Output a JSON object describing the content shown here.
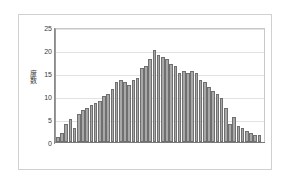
{
  "figure": {
    "background_color": "#ffffff",
    "frame_color": "#d0d0d0"
  },
  "chart_data": {
    "type": "bar",
    "title": "",
    "subtitle": "",
    "xlabel": "",
    "ylabel": "度数",
    "ylim": [
      0,
      25
    ],
    "yticks": [
      0,
      5,
      10,
      15,
      20,
      25
    ],
    "ytick_labels": [
      "0",
      "5",
      "10",
      "15",
      "20",
      "25"
    ],
    "xlim": [
      0,
      50
    ],
    "xticks": [],
    "xtick_labels": [],
    "grid": true,
    "grid_axis": "y",
    "grid_color": "#e2e2e2",
    "legend": null,
    "legend_position": "none",
    "bar_fill_color": "#a8a8a8",
    "bar_edge_color": "#6f6f6f",
    "axis_color": "#8a8a8a",
    "plot_border_color": "#c8c8c8",
    "tick_label_color": "#3a3a3a",
    "categories": [
      "1",
      "2",
      "3",
      "4",
      "5",
      "6",
      "7",
      "8",
      "9",
      "10",
      "11",
      "12",
      "13",
      "14",
      "15",
      "16",
      "17",
      "18",
      "19",
      "20",
      "21",
      "22",
      "23",
      "24",
      "25",
      "26",
      "27",
      "28",
      "29",
      "30",
      "31",
      "32",
      "33",
      "34",
      "35",
      "36",
      "37",
      "38",
      "39",
      "40",
      "41",
      "42",
      "43",
      "44",
      "45",
      "46",
      "47",
      "48",
      "49",
      "50"
    ],
    "values": [
      1,
      2,
      4,
      5,
      3,
      6,
      7,
      7.5,
      8,
      8.5,
      9,
      10,
      10.5,
      11.5,
      13,
      13.5,
      13,
      12.5,
      13.5,
      14,
      16,
      16.5,
      18,
      20,
      19,
      18.5,
      18,
      17,
      16.5,
      15,
      15.5,
      15,
      15.5,
      15,
      13.5,
      13,
      12,
      11,
      10.5,
      9.5,
      7.5,
      4,
      5.5,
      3.5,
      3,
      2.5,
      2,
      1.5,
      1.5,
      0
    ]
  }
}
